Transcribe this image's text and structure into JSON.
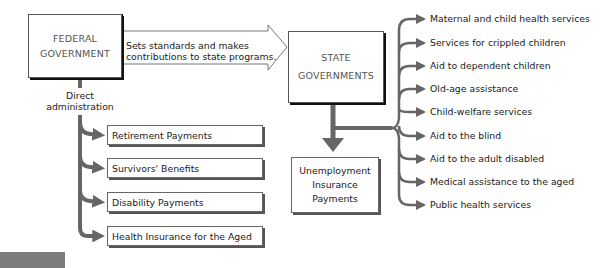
{
  "diagram": {
    "federal": {
      "line1": "FEDERAL",
      "line2": "GOVERNMENT"
    },
    "main_arrow": {
      "line1": "Sets standards and makes",
      "line2": "contributions to state programs."
    },
    "state": {
      "line1": "STATE",
      "line2": "GOVERNMENTS"
    },
    "direct": {
      "line1": "Direct",
      "line2": "administration"
    },
    "federal_programs": [
      {
        "label": "Retirement Payments"
      },
      {
        "label": "Survivors' Benefits"
      },
      {
        "label": "Disability Payments"
      },
      {
        "label": "Health Insurance for the Aged"
      }
    ],
    "unemployment": {
      "line1": "Unemployment",
      "line2": "Insurance",
      "line3": "Payments"
    },
    "state_programs": [
      {
        "label": "Maternal and child health services"
      },
      {
        "label": "Services for crippled children"
      },
      {
        "label": "Aid to dependent children"
      },
      {
        "label": "Old-age assistance"
      },
      {
        "label": "Child-welfare services"
      },
      {
        "label": "Aid to the blind"
      },
      {
        "label": "Aid to the adult disabled"
      },
      {
        "label": "Medical assistance to the aged"
      },
      {
        "label": "Public health services"
      }
    ],
    "colors": {
      "connector": "#666666",
      "box_shadow": "#111111",
      "grey_block": "#7d7d7d"
    }
  }
}
